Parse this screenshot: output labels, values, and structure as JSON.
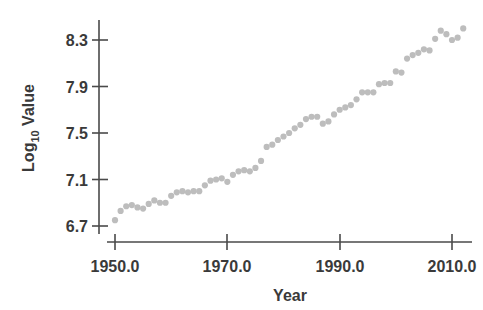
{
  "chart_data": {
    "type": "scatter",
    "title": "",
    "subtitle": "",
    "xlabel": "Year",
    "ylabel": "Log10 Value",
    "ylabel_base": "Log",
    "ylabel_sub": "10",
    "ylabel_tail": " Value",
    "xlim": [
      1948.0,
      2013.5
    ],
    "ylim": [
      6.58,
      8.52
    ],
    "grid": false,
    "legend": null,
    "marker": "circle",
    "marker_color": "#bdbdbd",
    "marker_size": 3.1,
    "xticks": [
      1950.0,
      1970.0,
      1990.0,
      2010.0
    ],
    "xtick_labels": [
      "1950.0",
      "1970.0",
      "1990.0",
      "2010.0"
    ],
    "yticks": [
      6.7,
      7.1,
      7.5,
      7.9,
      8.3
    ],
    "ytick_labels": [
      "6.7",
      "7.1",
      "7.5",
      "7.9",
      "8.3"
    ],
    "x": [
      1950,
      1951,
      1952,
      1953,
      1954,
      1955,
      1956,
      1957,
      1958,
      1959,
      1960,
      1961,
      1962,
      1963,
      1964,
      1965,
      1966,
      1967,
      1968,
      1969,
      1970,
      1971,
      1972,
      1973,
      1974,
      1975,
      1976,
      1977,
      1978,
      1979,
      1980,
      1981,
      1982,
      1983,
      1984,
      1985,
      1986,
      1987,
      1988,
      1989,
      1990,
      1991,
      1992,
      1993,
      1994,
      1995,
      1996,
      1997,
      1998,
      1999,
      2000,
      2001,
      2002,
      2003,
      2004,
      2005,
      2006,
      2007,
      2008,
      2009,
      2010,
      2011,
      2012
    ],
    "y": [
      6.75,
      6.83,
      6.87,
      6.88,
      6.86,
      6.85,
      6.89,
      6.92,
      6.9,
      6.9,
      6.96,
      6.99,
      7.0,
      6.99,
      7.0,
      7.0,
      7.05,
      7.09,
      7.1,
      7.11,
      7.08,
      7.14,
      7.17,
      7.18,
      7.17,
      7.2,
      7.26,
      7.38,
      7.4,
      7.44,
      7.47,
      7.5,
      7.54,
      7.57,
      7.62,
      7.64,
      7.64,
      7.58,
      7.6,
      7.66,
      7.7,
      7.72,
      7.74,
      7.79,
      7.85,
      7.85,
      7.85,
      7.92,
      7.93,
      7.93,
      8.03,
      8.02,
      8.14,
      8.17,
      8.19,
      8.22,
      8.21,
      8.31,
      8.38,
      8.35,
      8.3,
      8.32,
      8.4
    ]
  },
  "axes": {
    "y_title_text": "Log",
    "y_title_sub": "10",
    "y_title_tail": " Value",
    "x_title_text": "Year"
  }
}
